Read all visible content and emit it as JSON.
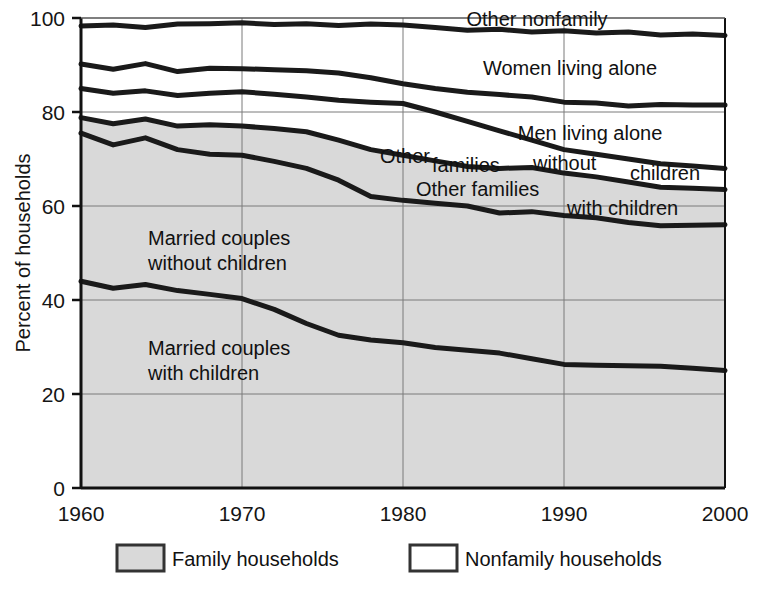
{
  "chart_data": {
    "type": "area",
    "title": "",
    "subtitle": "",
    "xlabel": "",
    "ylabel": "Percent of households",
    "xlim": [
      1960,
      2000
    ],
    "ylim": [
      0,
      100
    ],
    "x_ticks": [
      "1960",
      "1970",
      "1980",
      "1990",
      "2000"
    ],
    "y_ticks": [
      "0",
      "20",
      "40",
      "60",
      "80",
      "100"
    ],
    "grid": true,
    "legend_position": "bottom",
    "x": [
      1960,
      1962,
      1964,
      1966,
      1968,
      1970,
      1972,
      1974,
      1976,
      1978,
      1980,
      1982,
      1984,
      1986,
      1988,
      1990,
      1992,
      1994,
      1996,
      1998,
      2000
    ],
    "series": [
      {
        "name": "Married couples with children",
        "label": "Married couples\nwith children",
        "label_line1": "Married couples",
        "label_line2": "with children",
        "cumulative_values": [
          44.0,
          42.5,
          43.3,
          42.0,
          41.2,
          40.3,
          38.0,
          35.0,
          32.5,
          31.5,
          30.9,
          29.9,
          29.3,
          28.7,
          27.5,
          26.3,
          26.1,
          26.0,
          25.9,
          25.5,
          25.0
        ]
      },
      {
        "name": "Other families with children",
        "label": "Other families with children",
        "label_line1": "Other families",
        "label_line2": "with children",
        "cumulative_values": [
          75.5,
          73.0,
          74.5,
          72.0,
          71.0,
          70.8,
          69.5,
          68.0,
          65.5,
          62.0,
          61.2,
          60.6,
          60.0,
          58.5,
          58.8,
          58.0,
          57.5,
          56.5,
          55.8,
          55.9,
          56.0
        ]
      },
      {
        "name": "Other families without children",
        "label": "Other families without children",
        "label_line1": "Other",
        "label_line2": "families",
        "label_line3": "without",
        "label_line4": "children",
        "cumulative_values": [
          78.8,
          77.5,
          78.5,
          77.0,
          77.3,
          77.0,
          76.5,
          75.8,
          74.0,
          72.0,
          70.8,
          69.6,
          68.4,
          68.0,
          68.2,
          67.0,
          66.2,
          65.1,
          64.0,
          63.8,
          63.5
        ]
      },
      {
        "name": "Men living alone",
        "label": "Men living alone",
        "cumulative_values": [
          85.0,
          84.0,
          84.5,
          83.5,
          84.0,
          84.3,
          83.8,
          83.2,
          82.5,
          82.1,
          81.8,
          80.0,
          78.0,
          76.0,
          74.0,
          72.0,
          71.0,
          70.0,
          69.0,
          68.5,
          68.0
        ]
      },
      {
        "name": "Women living alone",
        "label": "Women living alone",
        "cumulative_values": [
          90.2,
          89.1,
          90.3,
          88.6,
          89.3,
          89.2,
          89.0,
          88.8,
          88.3,
          87.3,
          86.0,
          85.0,
          84.2,
          83.7,
          83.2,
          82.1,
          81.9,
          81.3,
          81.6,
          81.5,
          81.5
        ]
      },
      {
        "name": "Other nonfamily",
        "label": "Other nonfamily",
        "cumulative_values": [
          98.3,
          98.5,
          98.0,
          98.7,
          98.8,
          99.0,
          98.6,
          98.8,
          98.4,
          98.7,
          98.5,
          98.0,
          97.4,
          97.6,
          97.0,
          97.3,
          96.8,
          97.0,
          96.4,
          96.6,
          96.3
        ]
      }
    ],
    "legend": [
      {
        "label": "Family households",
        "swatch": "filled",
        "color": "#d9d9d9"
      },
      {
        "label": "Nonfamily households",
        "swatch": "empty",
        "color": "#ffffff"
      }
    ],
    "colors": {
      "family_fill": "#d9d9d9",
      "nonfamily_fill": "#ffffff",
      "line": "#1a1a1a",
      "grid": "#7a7a7a",
      "axis": "#111111",
      "text": "#111111"
    }
  }
}
